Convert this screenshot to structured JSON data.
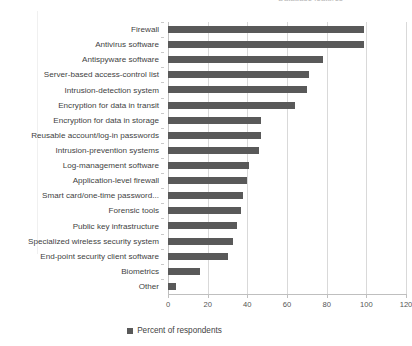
{
  "top_caption": "Database features",
  "chart_data": {
    "type": "bar",
    "orientation": "horizontal",
    "title": "",
    "xlabel": "",
    "ylabel": "",
    "xlim": [
      0,
      120
    ],
    "xticks": [
      "0",
      "20",
      "40",
      "60",
      "80",
      "100",
      "120"
    ],
    "grid": true,
    "legend_position": "bottom",
    "series": [
      {
        "name": "Percent of respondents",
        "color": "#595959",
        "values": [
          99,
          99,
          78,
          71,
          70,
          64,
          47,
          47,
          46,
          41,
          40,
          38,
          37,
          35,
          33,
          30,
          16,
          4
        ]
      }
    ],
    "categories": [
      "Firewall",
      "Antivirus software",
      "Antispyware software",
      "Server-based access-control list",
      "Intrusion-detection system",
      "Encryption for data in transit",
      "Encryption for data in storage",
      "Reusable account/log-in passwords",
      "Intrusion-prevention systems",
      "Log-management software",
      "Application-level firewall",
      "Smart card/one-time password...",
      "Forensic tools",
      "Public key infrastructure",
      "Specialized wireless security system",
      "End-point security client software",
      "Biometrics",
      "Other"
    ]
  },
  "legend": {
    "label": "Percent of respondents",
    "swatch_color": "#595959"
  },
  "colors": {
    "bar": "#595959",
    "gridline": "#d9d9d9",
    "axis": "#bfbfbf",
    "text": "#3f3f3f"
  }
}
